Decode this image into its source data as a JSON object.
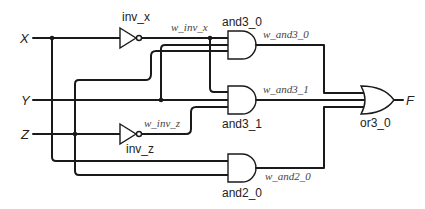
{
  "diagram": {
    "type": "logic-circuit",
    "inputs": [
      {
        "name": "X"
      },
      {
        "name": "Y"
      },
      {
        "name": "Z"
      }
    ],
    "outputs": [
      {
        "name": "F"
      }
    ],
    "gates": [
      {
        "id": "inv_x",
        "type": "NOT",
        "label": "inv_x"
      },
      {
        "id": "inv_z",
        "type": "NOT",
        "label": "inv_z"
      },
      {
        "id": "and3_0",
        "type": "AND3",
        "label": "and3_0"
      },
      {
        "id": "and3_1",
        "type": "AND3",
        "label": "and3_1"
      },
      {
        "id": "and2_0",
        "type": "AND2",
        "label": "and2_0"
      },
      {
        "id": "or3_0",
        "type": "OR3",
        "label": "or3_0"
      }
    ],
    "nets": [
      {
        "label": "w_inv_x"
      },
      {
        "label": "w_inv_z"
      },
      {
        "label": "w_and3_0"
      },
      {
        "label": "w_and3_1"
      },
      {
        "label": "w_and2_0"
      }
    ]
  }
}
